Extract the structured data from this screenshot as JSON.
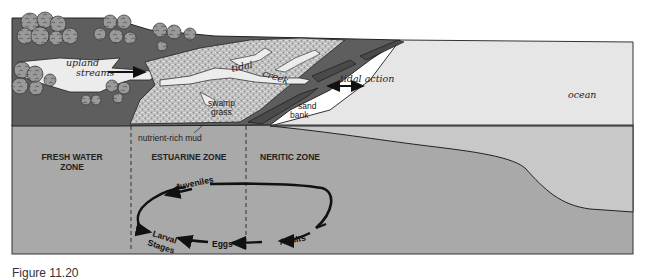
{
  "labels": {
    "upland_streams_1": "upland",
    "upland_streams_2": "streams",
    "tidal": "tidal",
    "creek": "creek",
    "tidal_action": "tidal action",
    "swamp": "swamp",
    "grass": "grass",
    "sand": "sand",
    "bank": "bank",
    "ocean": "ocean",
    "nutrient_mud": "nutrient-rich mud"
  },
  "zones": {
    "fresh_1": "FRESH WATER",
    "fresh_2": "ZONE",
    "estuarine": "ESTUARINE ZONE",
    "neritic": "NERITIC ZONE"
  },
  "lifecycle": {
    "juveniles": "Juveniles",
    "larval_1": "Larval",
    "larval_2": "Stages",
    "eggs": "Eggs",
    "adults": "Adults"
  },
  "caption": "Figure 11.20",
  "colors": {
    "ground": "#a9a9a9",
    "ocean_surface": "#e6e6e6",
    "ocean_deep": "#c9c9c9",
    "land": "#5e5e5e",
    "marsh": "#b3b3b3",
    "outline": "#222222"
  }
}
